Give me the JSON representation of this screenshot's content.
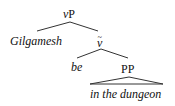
{
  "diagram": {
    "type": "syntax-tree",
    "nodes": {
      "root": {
        "label_prefix": "v",
        "label_suffix": "P"
      },
      "gilgamesh": {
        "text": "Gilgamesh"
      },
      "vbar": {
        "label": "v",
        "bar": "~"
      },
      "be": {
        "text": "be"
      },
      "pp": {
        "label": "PP"
      },
      "pp_leaf": {
        "text": "in the dungeon"
      }
    },
    "edges": [
      {
        "from": "vP",
        "to": "Gilgamesh"
      },
      {
        "from": "vP",
        "to": "v-bar"
      },
      {
        "from": "v-bar",
        "to": "be"
      },
      {
        "from": "v-bar",
        "to": "PP"
      },
      {
        "from": "PP",
        "to": "in the dungeon",
        "style": "triangle"
      }
    ],
    "line_color": "#333333",
    "text_color": "#111111"
  }
}
